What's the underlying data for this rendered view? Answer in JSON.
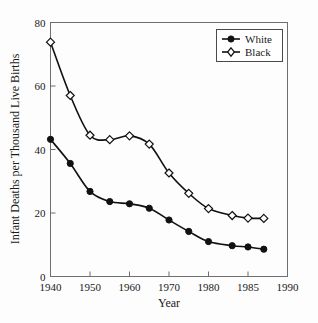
{
  "chart_data": {
    "type": "line",
    "title": "",
    "xlabel": "Year",
    "ylabel": "Infant Deaths per Thousand Live Births",
    "xlim": [
      1940,
      1990
    ],
    "ylim": [
      0,
      80
    ],
    "x_tick_labels": [
      "1940",
      "1950",
      "1960",
      "1970",
      "1980",
      "1985",
      "1990"
    ],
    "x_tick_values": [
      1940,
      1950,
      1960,
      1970,
      1980,
      1985,
      1990
    ],
    "y_tick_labels": [
      "0",
      "20",
      "40",
      "60",
      "80"
    ],
    "y_tick_values": [
      0,
      20,
      40,
      60,
      80
    ],
    "grid": false,
    "legend_position": "top-right",
    "x_axis_note": "non-linear: 1940-1950-1960-1970-1980 decades and 1980-1985-1990 half-decades are equally spaced",
    "series": [
      {
        "name": "White",
        "marker": "filled-circle",
        "x": [
          1940,
          1945,
          1950,
          1955,
          1960,
          1965,
          1970,
          1975,
          1980,
          1983,
          1985,
          1987
        ],
        "values": [
          43.2,
          35.6,
          26.8,
          23.6,
          22.9,
          21.5,
          17.8,
          14.2,
          11.0,
          9.7,
          9.3,
          8.6
        ]
      },
      {
        "name": "Black",
        "marker": "open-diamond",
        "x": [
          1940,
          1945,
          1950,
          1955,
          1960,
          1965,
          1970,
          1975,
          1980,
          1983,
          1985,
          1987
        ],
        "values": [
          73.8,
          57.0,
          44.5,
          43.1,
          44.3,
          41.7,
          32.6,
          26.2,
          21.4,
          19.2,
          18.4,
          18.3
        ]
      }
    ]
  },
  "legend": {
    "entries": [
      {
        "label": "White"
      },
      {
        "label": "Black"
      }
    ]
  },
  "axes": {
    "x_title": "Year",
    "y_title": "Infant Deaths per Thousand Live Births"
  },
  "colors": {
    "line": "#111111",
    "frame": "#6e6e6e",
    "background": "#fdfdfd",
    "text": "#1a1a1a"
  }
}
